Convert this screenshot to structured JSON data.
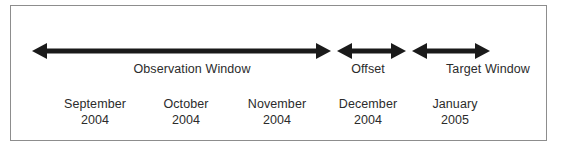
{
  "diagram": {
    "background_color": "#ffffff",
    "border_color": "#8d8d8d",
    "arrow_color": "#1a1a1a",
    "text_color": "#2b2b2b",
    "segments": [
      {
        "id": "observation-window",
        "label": "Observation Window",
        "arrow_name": "observation-window-arrow",
        "start_x": 32,
        "end_x": 331,
        "label_center_x": 192
      },
      {
        "id": "offset",
        "label": "Offset",
        "arrow_name": "offset-arrow",
        "start_x": 337,
        "end_x": 406,
        "label_center_x": 368
      },
      {
        "id": "target-window",
        "label": "Target Window",
        "arrow_name": "target-window-arrow",
        "start_x": 412,
        "end_x": 490,
        "label_center_x": 488
      }
    ],
    "months": [
      {
        "id": "september-2004",
        "name": "September",
        "year": "2004",
        "center_x": 95
      },
      {
        "id": "october-2004",
        "name": "October",
        "year": "2004",
        "center_x": 186
      },
      {
        "id": "november-2004",
        "name": "November",
        "year": "2004",
        "center_x": 277
      },
      {
        "id": "december-2004",
        "name": "December",
        "year": "2004",
        "center_x": 368
      },
      {
        "id": "january-2005",
        "name": "January",
        "year": "2005",
        "center_x": 455
      }
    ]
  }
}
